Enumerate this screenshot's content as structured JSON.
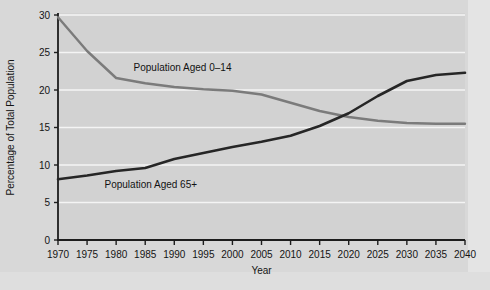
{
  "chart_data": {
    "type": "line",
    "title": "",
    "xlabel": "Year",
    "ylabel": "Percentage of Total Population",
    "xlim": [
      1970,
      2040
    ],
    "ylim": [
      0,
      30
    ],
    "grid": true,
    "legend_position": "inline-labels",
    "x_ticks": [
      "1970",
      "1975",
      "1980",
      "1985",
      "1990",
      "1995",
      "2000",
      "2005",
      "2010",
      "2015",
      "2020",
      "2025",
      "2030",
      "2035",
      "2040"
    ],
    "y_ticks": [
      "0",
      "5",
      "10",
      "15",
      "20",
      "25",
      "30"
    ],
    "x": [
      1970,
      1975,
      1980,
      1985,
      1990,
      1995,
      2000,
      2005,
      2010,
      2015,
      2020,
      2025,
      2030,
      2035,
      2040
    ],
    "series": [
      {
        "name": "Population Aged 0–14",
        "color": "#7b7b7b",
        "label_x": 1983,
        "label_y": 22.6,
        "values": [
          29.7,
          25.2,
          21.6,
          20.9,
          20.4,
          20.1,
          19.9,
          19.4,
          18.3,
          17.2,
          16.4,
          15.9,
          15.6,
          15.5,
          15.5
        ]
      },
      {
        "name": "Population Aged 65+",
        "color": "#262626",
        "label_x": 1978,
        "label_y": 7.0,
        "values": [
          8.1,
          8.6,
          9.2,
          9.6,
          10.8,
          11.6,
          12.4,
          13.1,
          13.9,
          15.2,
          16.9,
          19.2,
          21.2,
          22.0,
          22.3
        ]
      }
    ],
    "annotations": [
      {
        "text": "Population Aged 0–14",
        "year": 1983,
        "value": 22.6
      },
      {
        "text": "Population Aged 65+",
        "year": 1978,
        "value": 7.0
      }
    ]
  },
  "axes": {
    "y_title": "Percentage of Total Population",
    "x_title": "Year"
  }
}
